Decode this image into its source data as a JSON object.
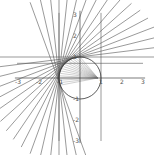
{
  "figure": {
    "type": "geometry-plot",
    "axes": {
      "x_ticks": [
        "-3",
        "-2",
        "-1",
        "1",
        "2",
        "3"
      ],
      "y_ticks": [
        "3",
        "2",
        "1",
        "-1",
        "-2",
        "-3"
      ],
      "x_range": [
        -3,
        3
      ],
      "y_range": [
        -3,
        3
      ]
    },
    "circle": {
      "cx": 0,
      "cy": 0,
      "r": 1
    },
    "focus_point": {
      "x": 0.85,
      "y": 0
    },
    "vertical_lines_x": [
      -1,
      1
    ],
    "horizontal_line_y": 0.7,
    "tangent_angles_deg": [
      90,
      97,
      104,
      111,
      118,
      125,
      132,
      139,
      146,
      153,
      160,
      167,
      174,
      180,
      186,
      193,
      200
    ],
    "colors": {
      "line": "#555555",
      "axis": "#444444",
      "background": "#ffffff"
    }
  }
}
